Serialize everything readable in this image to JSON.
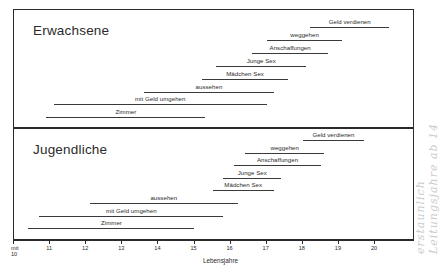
{
  "figure": {
    "axis_title": "Lebensjahre",
    "margin_note_line1": "erstaunlich",
    "margin_note_line2": "Leitungsjahre ab 14"
  },
  "axis": {
    "ticks": [
      {
        "value": 10,
        "label_top": "mit",
        "label_bottom": "10"
      },
      {
        "value": 11,
        "label": "11"
      },
      {
        "value": 12,
        "label": "12"
      },
      {
        "value": 13,
        "label": "13"
      },
      {
        "value": 14,
        "label": "14"
      },
      {
        "value": 15,
        "label": "15"
      },
      {
        "value": 16,
        "label": "16"
      },
      {
        "value": 17,
        "label": "17"
      },
      {
        "value": 18,
        "label": "18"
      },
      {
        "value": 19,
        "label": "19"
      },
      {
        "value": 20,
        "label": "20"
      }
    ]
  },
  "panels": [
    {
      "id": "adults",
      "title": "Erwachsene",
      "bars": [
        {
          "label": "Geld verdienen",
          "start": 18.2,
          "end": 20.4
        },
        {
          "label": "weggehen",
          "start": 17.0,
          "end": 19.1
        },
        {
          "label": "Anschaffungen",
          "start": 16.6,
          "end": 18.7
        },
        {
          "label": "Junge Sex",
          "start": 15.6,
          "end": 18.1
        },
        {
          "label": "Mädchen Sex",
          "start": 15.2,
          "end": 17.6
        },
        {
          "label": "aussehen",
          "start": 13.6,
          "end": 17.2
        },
        {
          "label": "mit Geld umgehen",
          "start": 11.1,
          "end": 17.0
        },
        {
          "label": "Zimmer",
          "start": 10.9,
          "end": 15.3
        }
      ]
    },
    {
      "id": "youth",
      "title": "Jugendliche",
      "bars": [
        {
          "label": "Geld verdienen",
          "start": 18.0,
          "end": 19.7
        },
        {
          "label": "weggehen",
          "start": 16.4,
          "end": 18.6
        },
        {
          "label": "Anschaffungen",
          "start": 16.1,
          "end": 18.5
        },
        {
          "label": "Junge Sex",
          "start": 15.8,
          "end": 17.4
        },
        {
          "label": "Mädchen Sex",
          "start": 15.5,
          "end": 17.2
        },
        {
          "label": "aussehen",
          "start": 12.1,
          "end": 16.2
        },
        {
          "label": "mit Geld umgehen",
          "start": 10.7,
          "end": 15.8
        },
        {
          "label": "Zimmer",
          "start": 10.4,
          "end": 15.0
        }
      ]
    }
  ],
  "chart_data": {
    "type": "bar",
    "orientation": "horizontal-range",
    "title": "",
    "xlabel": "Lebensjahre",
    "ylabel": "",
    "xlim": [
      10,
      21
    ],
    "grid": false,
    "legend": false,
    "x_ticks": [
      "mit 10",
      "11",
      "12",
      "13",
      "14",
      "15",
      "16",
      "17",
      "18",
      "19",
      "20"
    ],
    "groups": [
      {
        "name": "Erwachsene",
        "categories": [
          "Geld verdienen",
          "weggehen",
          "Anschaffungen",
          "Junge Sex",
          "Mädchen Sex",
          "aussehen",
          "mit Geld umgehen",
          "Zimmer"
        ],
        "ranges": [
          [
            18.2,
            20.4
          ],
          [
            17.0,
            19.1
          ],
          [
            16.6,
            18.7
          ],
          [
            15.6,
            18.1
          ],
          [
            15.2,
            17.6
          ],
          [
            13.6,
            17.2
          ],
          [
            11.1,
            17.0
          ],
          [
            10.9,
            15.3
          ]
        ]
      },
      {
        "name": "Jugendliche",
        "categories": [
          "Geld verdienen",
          "weggehen",
          "Anschaffungen",
          "Junge Sex",
          "Mädchen Sex",
          "aussehen",
          "mit Geld umgehen",
          "Zimmer"
        ],
        "ranges": [
          [
            18.0,
            19.7
          ],
          [
            16.4,
            18.6
          ],
          [
            16.1,
            18.5
          ],
          [
            15.8,
            17.4
          ],
          [
            15.5,
            17.2
          ],
          [
            12.1,
            16.2
          ],
          [
            10.7,
            15.8
          ],
          [
            10.4,
            15.0
          ]
        ]
      }
    ]
  }
}
